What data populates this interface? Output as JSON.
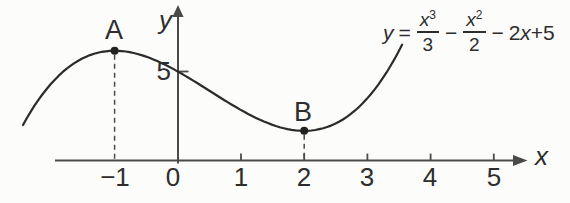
{
  "equation": {
    "lhs": "y",
    "eq": "=",
    "frac1": {
      "num_base": "x",
      "num_exp": "3",
      "den": "3"
    },
    "op1": "−",
    "frac2": {
      "num_base": "x",
      "num_exp": "2",
      "den": "2"
    },
    "op2": "−",
    "tail_coeff": "2",
    "tail_var": "x",
    "tail_rest": "+5"
  },
  "labels": {
    "x_axis": "x",
    "y_axis": "y",
    "y_tick": "5"
  },
  "chart_data": {
    "type": "line",
    "equation_text": "y = x³/3 − x²/2 − 2x + 5",
    "coefficients": {
      "x3": 0.3333333,
      "x2": -0.5,
      "x1": -2,
      "x0": 5
    },
    "x_range_drawn": [
      -2.45,
      3.55
    ],
    "x": [
      -2.5,
      -2,
      -1.5,
      -1,
      -0.5,
      0,
      0.5,
      1,
      1.5,
      2,
      2.5,
      3,
      3.5
    ],
    "y": [
      1.67,
      4.33,
      5.75,
      6.17,
      5.83,
      5,
      3.92,
      2.83,
      2,
      1.67,
      2.08,
      3.5,
      6.17
    ],
    "xlabel": "x",
    "ylabel": "y",
    "x_ticks": [
      -1,
      0,
      1,
      2,
      3,
      4,
      5
    ],
    "x_tick_labels": [
      "−1",
      "0",
      "1",
      "2",
      "3",
      "4",
      "5"
    ],
    "y_ticks": [
      5
    ],
    "y_tick_labels": [
      "5"
    ],
    "points": [
      {
        "label": "A",
        "x": -1,
        "y": 6.17,
        "kind": "local-maximum"
      },
      {
        "label": "B",
        "x": 2,
        "y": 1.67,
        "kind": "local-minimum"
      }
    ],
    "xlim": [
      -2.9,
      5.6
    ],
    "grid": false,
    "legend": "none"
  },
  "style": {
    "ink": "#2b2b2b",
    "axis": "#4a4a4a",
    "background": "#fcfcfa"
  }
}
